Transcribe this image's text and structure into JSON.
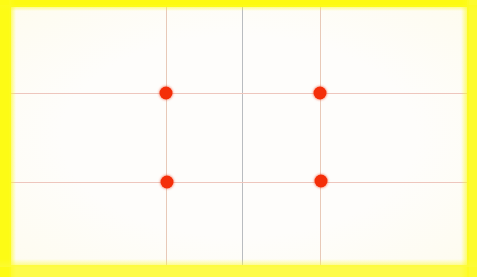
{
  "image": {
    "kind": "photographic-composition-guide",
    "description": "Blank white photo frame with yellow border and a rule-of-thirds grid overlay marked by four red focus points",
    "width": 477,
    "height": 277
  },
  "frame": {
    "name": "yellow-photo-border",
    "color": "#fdfb23",
    "edge_color_top": "#fdfa10",
    "edge_color_right": "#fdfb2e",
    "edge_color_bottom": "#fdfb49",
    "edge_color_left": "#fdfb15",
    "thickness_top_px": 7,
    "thickness_right_px": 10,
    "thickness_bottom_px": 12,
    "thickness_left_px": 11
  },
  "canvas": {
    "name": "image-area",
    "background": "#fefdfb",
    "width": 456,
    "height": 258
  },
  "grid": {
    "name": "rule-of-thirds-grid",
    "vertical_count": 3,
    "horizontal_count": 2,
    "thirds_vertical_color": "#e8c9b8",
    "thirds_horizontal_color": "#eec6bd",
    "center_vertical_color": "#b9bcc0",
    "vertical_lines": [
      {
        "id": "v-line-1",
        "label": "left third",
        "x": 166
      },
      {
        "id": "v-line-center",
        "label": "center",
        "x": 242
      },
      {
        "id": "v-line-2",
        "label": "right third",
        "x": 320
      }
    ],
    "horizontal_lines": [
      {
        "id": "h-line-1",
        "label": "upper third",
        "y": 93
      },
      {
        "id": "h-line-2",
        "label": "lower third",
        "y": 182
      }
    ]
  },
  "focus_points": {
    "name": "intersection-markers",
    "color": "#f42e09",
    "diameter_px": 13,
    "count": 4,
    "points": [
      {
        "id": "dot-tl",
        "label": "top-left intersection",
        "x": 166,
        "y": 93
      },
      {
        "id": "dot-tr",
        "label": "top-right intersection",
        "x": 320,
        "y": 93
      },
      {
        "id": "dot-bl",
        "label": "bottom-left intersection",
        "x": 167,
        "y": 182
      },
      {
        "id": "dot-br",
        "label": "bottom-right intersection",
        "x": 321,
        "y": 181
      }
    ]
  }
}
